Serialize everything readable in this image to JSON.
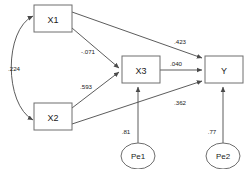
{
  "diagram": {
    "type": "path-diagram",
    "title": "",
    "background_color": "#ffffff",
    "node_stroke_color": "#6e6e6e",
    "edge_stroke_color": "#4a4a4a",
    "text_color": "#1a1a1a",
    "nodes": [
      {
        "id": "x1",
        "label": "X1",
        "shape": "rectangle",
        "x": 34,
        "y": 5,
        "w": 38,
        "h": 27
      },
      {
        "id": "x2",
        "label": "X2",
        "shape": "rectangle",
        "x": 34,
        "y": 103,
        "w": 38,
        "h": 27
      },
      {
        "id": "x3",
        "label": "X3",
        "shape": "rectangle",
        "x": 122,
        "y": 56,
        "w": 38,
        "h": 27
      },
      {
        "id": "y",
        "label": "Y",
        "shape": "rectangle",
        "x": 205,
        "y": 56,
        "w": 38,
        "h": 27
      },
      {
        "id": "pe1",
        "label": "Pe1",
        "shape": "ellipse",
        "cx": 138,
        "cy": 156,
        "rx": 17,
        "ry": 13
      },
      {
        "id": "pe2",
        "label": "Pe2",
        "shape": "ellipse",
        "cx": 223,
        "cy": 156,
        "rx": 17,
        "ry": 13
      }
    ],
    "edges": [
      {
        "id": "x1-x2",
        "from": "X1",
        "to": "X2",
        "kind": "covariance-double-arrow",
        "coefficient": ".224"
      },
      {
        "id": "x1-x3",
        "from": "X1",
        "to": "X3",
        "kind": "regression-arrow",
        "coefficient": "-.071"
      },
      {
        "id": "x2-x3",
        "from": "X2",
        "to": "X3",
        "kind": "regression-arrow",
        "coefficient": ".593"
      },
      {
        "id": "x1-y",
        "from": "X1",
        "to": "Y",
        "kind": "regression-arrow",
        "coefficient": ".423"
      },
      {
        "id": "x3-y",
        "from": "X3",
        "to": "Y",
        "kind": "regression-arrow",
        "coefficient": ".040"
      },
      {
        "id": "x2-y",
        "from": "X2",
        "to": "Y",
        "kind": "regression-arrow",
        "coefficient": ".362"
      },
      {
        "id": "pe1-x3",
        "from": "Pe1",
        "to": "X3",
        "kind": "error-arrow",
        "coefficient": ".81"
      },
      {
        "id": "pe2-y",
        "from": "Pe2",
        "to": "Y",
        "kind": "error-arrow",
        "coefficient": ".77"
      }
    ],
    "labels": {
      "cov_x1_x2": {
        "text": ".224",
        "x": 14,
        "y": 68
      },
      "path_x1_x3": {
        "text": "-.071",
        "x": 88,
        "y": 51
      },
      "path_x2_x3": {
        "text": ".593",
        "x": 86,
        "y": 86
      },
      "path_x1_y": {
        "text": ".423",
        "x": 180,
        "y": 41
      },
      "path_x3_y": {
        "text": ".040",
        "x": 176,
        "y": 63
      },
      "path_x2_y": {
        "text": ".362",
        "x": 180,
        "y": 102
      },
      "err_pe1": {
        "text": ".81",
        "x": 126,
        "y": 131
      },
      "err_pe2": {
        "text": ".77",
        "x": 212,
        "y": 131
      }
    }
  }
}
